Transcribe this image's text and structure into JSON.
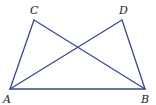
{
  "diagram": {
    "stroke_color": "#3a4a8c",
    "points": [
      {
        "name": "A",
        "x": 10,
        "y": 89,
        "label_x": 3,
        "label_y": 103
      },
      {
        "name": "B",
        "x": 145,
        "y": 89,
        "label_x": 141,
        "label_y": 103
      },
      {
        "name": "C",
        "x": 34,
        "y": 20,
        "label_x": 30,
        "label_y": 14
      },
      {
        "name": "D",
        "x": 122,
        "y": 20,
        "label_x": 119,
        "label_y": 14
      }
    ],
    "segments": [
      [
        "A",
        "B"
      ],
      [
        "A",
        "C"
      ],
      [
        "A",
        "D"
      ],
      [
        "B",
        "C"
      ],
      [
        "B",
        "D"
      ]
    ]
  }
}
